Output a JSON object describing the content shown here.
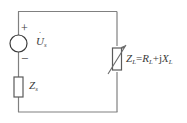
{
  "diagram": {
    "background_color": "#ffffff",
    "line_color": "#808080",
    "text_color": "#3a3a3a"
  },
  "source": {
    "symbol": "ac-voltage-source-circle",
    "label_base": "U",
    "label_dot": "˙",
    "label_subscript": "s",
    "polarity_plus": "+",
    "polarity_minus": "−"
  },
  "series_impedance": {
    "symbol": "impedance-box",
    "label_base": "Z",
    "label_subscript": "s"
  },
  "load_impedance": {
    "symbol": "variable-impedance-box-with-arrow",
    "label_base": "Z",
    "label_subscript": "L",
    "equals": "=",
    "real_base": "R",
    "real_subscript": "L",
    "plus": "+",
    "imag_unit": "j",
    "imag_base": "X",
    "imag_subscript": "L"
  },
  "wires": {
    "top": "top-wire",
    "bottom": "bottom-wire",
    "left": "left-branch",
    "right": "right-branch"
  }
}
